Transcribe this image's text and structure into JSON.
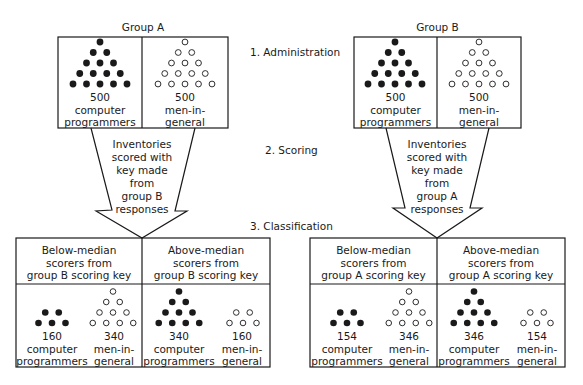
{
  "steps": [
    {
      "label": "1. Administration"
    },
    {
      "label": "2. Scoring"
    },
    {
      "label": "3. Classification"
    }
  ],
  "groups": [
    {
      "title": "Group A",
      "cells": [
        {
          "count": "500",
          "line1": "computer",
          "line2": "programmers",
          "dot_rows": 5,
          "filled": true
        },
        {
          "count": "500",
          "line1": "men-in-",
          "line2": "general",
          "dot_rows": 5,
          "filled": false
        }
      ],
      "arrow": {
        "lines": [
          "Inventories",
          "scored with",
          "key made",
          "from",
          "group B",
          "responses"
        ]
      },
      "classification": [
        {
          "header": [
            "Below-median",
            "scorers from",
            "group B scoring key"
          ],
          "cells": [
            {
              "count": "160",
              "line1": "computer",
              "line2": "programmers",
              "dot_pattern": [
                2,
                3
              ],
              "filled": true
            },
            {
              "count": "340",
              "line1": "men-in-",
              "line2": "general",
              "dot_pattern": [
                1,
                2,
                3,
                4
              ],
              "filled": false
            }
          ]
        },
        {
          "header": [
            "Above-median",
            "scorers from",
            "group B scoring key"
          ],
          "cells": [
            {
              "count": "340",
              "line1": "computer",
              "line2": "programmers",
              "dot_pattern": [
                1,
                2,
                3,
                4
              ],
              "filled": true
            },
            {
              "count": "160",
              "line1": "men-in-",
              "line2": "general",
              "dot_pattern": [
                2,
                3
              ],
              "filled": false
            }
          ]
        }
      ]
    },
    {
      "title": "Group B",
      "cells": [
        {
          "count": "500",
          "line1": "computer",
          "line2": "programmers",
          "dot_rows": 5,
          "filled": true
        },
        {
          "count": "500",
          "line1": "men-in-",
          "line2": "general",
          "dot_rows": 5,
          "filled": false
        }
      ],
      "arrow": {
        "lines": [
          "Inventories",
          "scored with",
          "key made",
          "from",
          "group A",
          "responses"
        ]
      },
      "classification": [
        {
          "header": [
            "Below-median",
            "scorers from",
            "group A scoring key"
          ],
          "cells": [
            {
              "count": "154",
              "line1": "computer",
              "line2": "programmers",
              "dot_pattern": [
                2,
                3
              ],
              "filled": true
            },
            {
              "count": "346",
              "line1": "men-in-",
              "line2": "general",
              "dot_pattern": [
                1,
                2,
                3,
                4
              ],
              "filled": false
            }
          ]
        },
        {
          "header": [
            "Above-median",
            "scorers from",
            "group A scoring key"
          ],
          "cells": [
            {
              "count": "346",
              "line1": "computer",
              "line2": "programmers",
              "dot_pattern": [
                1,
                2,
                3,
                4
              ],
              "filled": true
            },
            {
              "count": "154",
              "line1": "men-in-",
              "line2": "general",
              "dot_pattern": [
                2,
                3
              ],
              "filled": false
            }
          ]
        }
      ]
    }
  ],
  "colors": {
    "ink": "#1a1a1a",
    "background": "#ffffff"
  }
}
